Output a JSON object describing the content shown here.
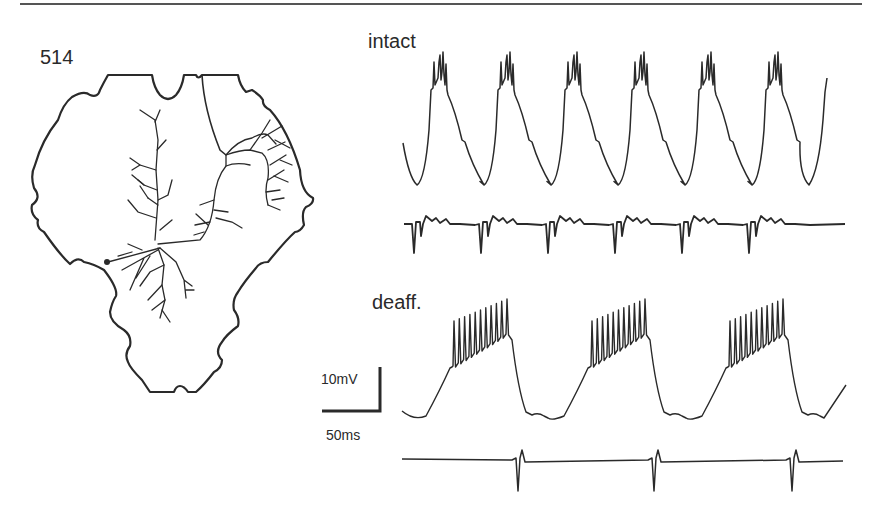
{
  "figure": {
    "cell_label": "514",
    "conditions": [
      {
        "label": "intact"
      },
      {
        "label": "deaff."
      }
    ],
    "scale_bar": {
      "vertical_label": "10mV",
      "horizontal_label": "50ms"
    },
    "colors": {
      "ink": "#2a2a2a",
      "background": "#ffffff"
    }
  },
  "chart_data": [
    {
      "type": "line",
      "title": "intact",
      "series": [
        {
          "name": "intracellular membrane potential",
          "cycles": 6,
          "spikes_per_burst": 4,
          "period_px": 67
        },
        {
          "name": "extracellular nerve recording",
          "large_units_per_cycle": 1
        }
      ]
    },
    {
      "type": "line",
      "title": "deaff.",
      "series": [
        {
          "name": "intracellular membrane potential",
          "cycles": 3,
          "spikes_per_burst": 11,
          "period_px": 138
        },
        {
          "name": "extracellular nerve recording",
          "large_units_per_cycle": 1
        }
      ]
    }
  ]
}
